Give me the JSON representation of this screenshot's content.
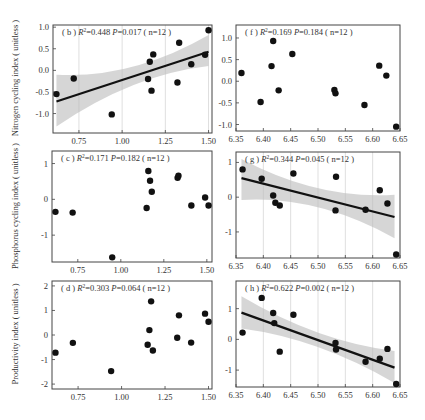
{
  "chart_data": [
    {
      "id": "b",
      "type": "scatter",
      "panel_label": "( b )",
      "stats": "R²=0.448  P=0.017 ( n=12 )",
      "r2": "0.448",
      "p": "0.017",
      "n": "12",
      "ylabel": "Nitrogen cycling index ( unitless )",
      "xlabel": "",
      "xlim": [
        0.6,
        1.52
      ],
      "ylim": [
        -1.45,
        1.05
      ],
      "xticks": [
        0.75,
        1.0,
        1.25,
        1.5
      ],
      "xtick_labels": [
        "0.75",
        "1.00",
        "1.25",
        "1.50"
      ],
      "yticks": [
        -1.0,
        -0.5,
        0.0,
        0.5,
        1.0
      ],
      "ytick_labels": [
        "-1.0",
        "-0.5",
        "0.0",
        "0.5",
        "1.0"
      ],
      "x": [
        0.62,
        0.72,
        0.94,
        1.15,
        1.16,
        1.17,
        1.18,
        1.32,
        1.33,
        1.4,
        1.48,
        1.5
      ],
      "y": [
        -0.55,
        -0.19,
        -1.02,
        -0.2,
        0.2,
        -0.47,
        0.37,
        -0.28,
        0.64,
        0.14,
        0.36,
        0.93
      ],
      "fit": {
        "x": [
          0.62,
          1.5
        ],
        "y": [
          -0.72,
          0.43
        ],
        "ci_lower": [
          -1.3,
          0.1
        ],
        "ci_upper": [
          -0.1,
          0.82
        ]
      },
      "frame": {
        "left": 53,
        "top": 25,
        "right": 212,
        "bottom": 133
      }
    },
    {
      "id": "f",
      "type": "scatter",
      "panel_label": "( f )",
      "stats": "R²=0.169  P=0.184 ( n=12 )",
      "r2": "0.169",
      "p": "0.184",
      "n": "12",
      "ylabel": "",
      "xlabel": "",
      "xlim": [
        6.35,
        6.65
      ],
      "ylim": [
        -1.15,
        1.3
      ],
      "xticks": [
        6.35,
        6.4,
        6.45,
        6.5,
        6.55,
        6.6,
        6.65
      ],
      "xtick_labels": [
        "6.35",
        "6.40",
        "6.45",
        "6.50",
        "6.55",
        "6.60",
        "6.65"
      ],
      "yticks": [
        -1.0,
        -0.5,
        0.0,
        0.5,
        1.0
      ],
      "ytick_labels": [
        "-1.0",
        "-0.5",
        "0.0",
        "0.5",
        "1.0"
      ],
      "x": [
        6.36,
        6.395,
        6.415,
        6.418,
        6.428,
        6.453,
        6.53,
        6.532,
        6.585,
        6.612,
        6.625,
        6.643
      ],
      "y": [
        0.19,
        -0.48,
        0.35,
        0.93,
        -0.21,
        0.63,
        -0.2,
        -0.28,
        -0.55,
        0.36,
        0.13,
        -1.05
      ],
      "fit": null,
      "frame": {
        "left": 236,
        "top": 25,
        "right": 400,
        "bottom": 131
      }
    },
    {
      "id": "c",
      "type": "scatter",
      "panel_label": "( c )",
      "stats": "R²=0.171  P=0.182 ( n=12 )",
      "r2": "0.171",
      "p": "0.182",
      "n": "12",
      "ylabel": "Phosphorus cycling index ( unitless )",
      "xlabel": "",
      "xlim": [
        0.6,
        1.53
      ],
      "ylim": [
        -1.75,
        1.35
      ],
      "xticks": [
        0.75,
        1.0,
        1.25,
        1.5
      ],
      "xtick_labels": [
        "0.75",
        "1.00",
        "1.25",
        "1.50"
      ],
      "yticks": [
        -1,
        0,
        1
      ],
      "ytick_labels": [
        "-1",
        "0",
        "1"
      ],
      "x": [
        0.62,
        0.72,
        0.95,
        1.15,
        1.16,
        1.17,
        1.18,
        1.33,
        1.335,
        1.41,
        1.49,
        1.51
      ],
      "y": [
        -0.35,
        -0.37,
        -1.62,
        -0.24,
        0.79,
        0.52,
        0.21,
        0.6,
        0.66,
        -0.17,
        0.05,
        -0.17
      ],
      "fit": null,
      "frame": {
        "left": 52,
        "top": 151,
        "right": 212,
        "bottom": 262
      }
    },
    {
      "id": "g",
      "type": "scatter",
      "panel_label": "( g )",
      "stats": "R²=0.344  P=0.045 ( n=12 )",
      "r2": "0.344",
      "p": "0.045",
      "n": "12",
      "ylabel": "",
      "xlabel": "",
      "xlim": [
        6.35,
        6.65
      ],
      "ylim": [
        -1.75,
        1.3
      ],
      "xticks": [
        6.35,
        6.4,
        6.45,
        6.5,
        6.55,
        6.6,
        6.65
      ],
      "xtick_labels": [
        "6.35",
        "6.40",
        "6.45",
        "6.50",
        "6.55",
        "6.60",
        "6.65"
      ],
      "yticks": [
        -1,
        0,
        1
      ],
      "ytick_labels": [
        "-1",
        "0",
        "1"
      ],
      "x": [
        6.362,
        6.397,
        6.418,
        6.422,
        6.43,
        6.455,
        6.532,
        6.533,
        6.587,
        6.613,
        6.627,
        6.643
      ],
      "y": [
        0.8,
        0.53,
        0.05,
        -0.16,
        -0.24,
        0.68,
        -0.38,
        0.59,
        -0.36,
        0.2,
        -0.18,
        -1.65
      ],
      "fit": {
        "x": [
          6.36,
          6.64
        ],
        "y": [
          0.55,
          -0.57
        ],
        "ci_lower": [
          -0.08,
          -1.18
        ],
        "ci_upper": [
          1.1,
          0.07
        ]
      },
      "frame": {
        "left": 236,
        "top": 152,
        "right": 400,
        "bottom": 258
      }
    },
    {
      "id": "d",
      "type": "scatter",
      "panel_label": "( d )",
      "stats": "R²=0.303  P=0.064 ( n=12 )",
      "r2": "0.303",
      "p": "0.064",
      "n": "12",
      "ylabel": "Productivity index ( unitless )",
      "xlabel": "",
      "xlim": [
        0.6,
        1.52
      ],
      "ylim": [
        -2.2,
        2.2
      ],
      "xticks": [
        0.75,
        1.0,
        1.25,
        1.5
      ],
      "xtick_labels": [
        "0.75",
        "1.00",
        "1.25",
        "1.50"
      ],
      "yticks": [
        -2,
        -1,
        0,
        1,
        2
      ],
      "ytick_labels": [
        "-2",
        "-1",
        "0",
        "1",
        "2"
      ],
      "x": [
        0.62,
        0.72,
        0.94,
        1.15,
        1.16,
        1.17,
        1.18,
        1.32,
        1.33,
        1.4,
        1.48,
        1.5
      ],
      "y": [
        -0.72,
        -0.32,
        -1.47,
        -0.4,
        0.2,
        1.37,
        -0.63,
        -0.11,
        0.8,
        -0.31,
        0.87,
        0.54
      ],
      "fit": null,
      "frame": {
        "left": 52,
        "top": 281,
        "right": 212,
        "bottom": 389
      }
    },
    {
      "id": "h",
      "type": "scatter",
      "panel_label": "( h )",
      "stats": "R²=0.622  P=0.002 ( n=12 )",
      "r2": "0.622",
      "p": "0.002",
      "n": "12",
      "ylabel": "",
      "xlabel": "",
      "xlim": [
        6.35,
        6.65
      ],
      "ylim": [
        -1.55,
        1.9
      ],
      "xticks": [
        6.35,
        6.4,
        6.45,
        6.5,
        6.55,
        6.6,
        6.65
      ],
      "xtick_labels": [
        "6.35",
        "6.40",
        "6.45",
        "6.50",
        "6.55",
        "6.60",
        "6.65"
      ],
      "yticks": [
        -1,
        0,
        1
      ],
      "ytick_labels": [
        "-1",
        "0",
        "1"
      ],
      "x": [
        6.362,
        6.397,
        6.418,
        6.42,
        6.43,
        6.455,
        6.532,
        6.533,
        6.587,
        6.613,
        6.627,
        6.643
      ],
      "y": [
        0.22,
        1.35,
        0.86,
        0.53,
        -0.4,
        0.8,
        -0.12,
        -0.33,
        -0.73,
        -0.63,
        -0.31,
        -1.45
      ],
      "fit": {
        "x": [
          6.36,
          6.64
        ],
        "y": [
          0.87,
          -0.92
        ],
        "ci_lower": [
          0.35,
          -1.42
        ],
        "ci_upper": [
          1.4,
          -0.38
        ]
      },
      "frame": {
        "left": 236,
        "top": 281,
        "right": 400,
        "bottom": 387
      }
    }
  ],
  "style": {
    "point_color": "#111111",
    "line_color": "#111111",
    "ci_fill": "#cfcfcf",
    "frame_color": "#444444",
    "text_color": "#333333"
  }
}
